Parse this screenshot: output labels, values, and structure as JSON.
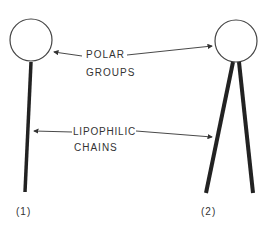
{
  "diagram": {
    "labels": {
      "polar_line1": "POLAR",
      "polar_line2": "GROUPS",
      "lipophilic_line1": "LIPOPHILIC",
      "lipophilic_line2": "CHAINS"
    },
    "molecules": [
      {
        "id": "1",
        "caption": "(1)",
        "heads": 1,
        "tails": 1
      },
      {
        "id": "2",
        "caption": "(2)",
        "heads": 1,
        "tails": 2
      }
    ],
    "colors": {
      "stroke": "#222222",
      "text": "#333333",
      "background": "#ffffff"
    }
  }
}
